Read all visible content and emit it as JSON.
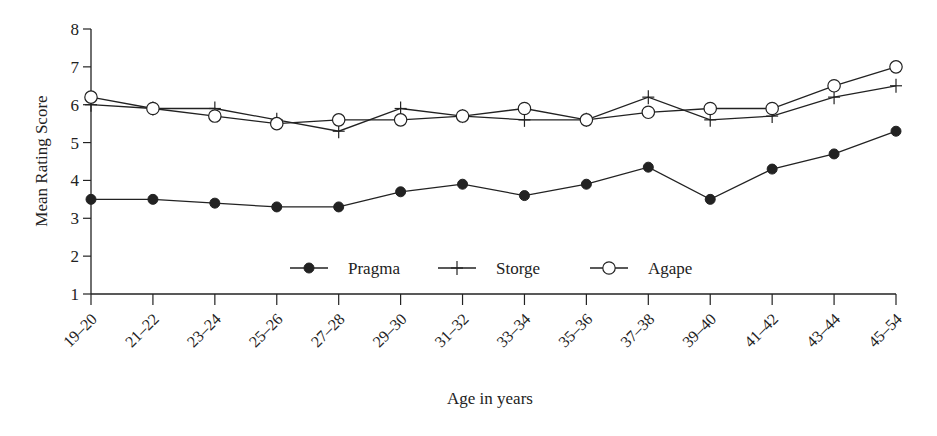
{
  "chart_data": {
    "type": "line",
    "title": "",
    "xlabel": "Age in years",
    "ylabel": "Mean Rating Score",
    "ylim": [
      1,
      8
    ],
    "yticks": [
      1,
      2,
      3,
      4,
      5,
      6,
      7,
      8
    ],
    "grid": false,
    "legend_position": "inside-bottom-center",
    "categories": [
      "19–20",
      "21–22",
      "23–24",
      "25–26",
      "27–28",
      "29–30",
      "31–32",
      "33–34",
      "35–36",
      "37–38",
      "39–40",
      "41–42",
      "43–44",
      "45–54"
    ],
    "series": [
      {
        "name": "Pragma",
        "marker": "filled-circle",
        "values": [
          3.5,
          3.5,
          3.4,
          3.3,
          3.3,
          3.7,
          3.9,
          3.6,
          3.9,
          4.35,
          3.5,
          4.3,
          4.7,
          5.3
        ]
      },
      {
        "name": "Storge",
        "marker": "plus",
        "values": [
          6.0,
          5.9,
          5.9,
          5.6,
          5.3,
          5.9,
          5.7,
          5.6,
          5.6,
          6.2,
          5.6,
          5.7,
          6.2,
          6.5
        ]
      },
      {
        "name": "Agape",
        "marker": "open-circle",
        "values": [
          6.2,
          5.9,
          5.7,
          5.5,
          5.6,
          5.6,
          5.7,
          5.9,
          5.6,
          5.8,
          5.9,
          5.9,
          6.5,
          7.0
        ]
      }
    ]
  },
  "colors": {
    "line": "#222222",
    "background": "#ffffff"
  }
}
